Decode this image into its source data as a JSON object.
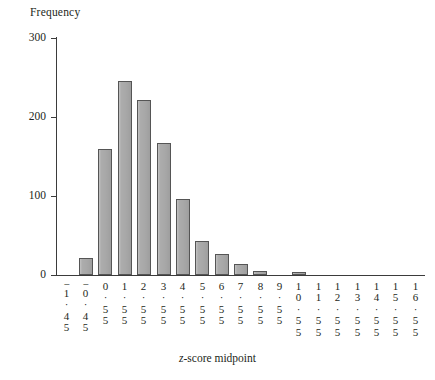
{
  "axes": {
    "y_title": "Frequency",
    "x_title_prefix": "z",
    "x_title_rest": "-score midpoint",
    "y_ticks": [
      "300",
      "200",
      "100",
      "0"
    ]
  },
  "chart_data": {
    "type": "bar",
    "title": "",
    "subtitle": "",
    "xlabel": "z-score midpoint",
    "ylabel": "Frequency",
    "ylim": [
      0,
      300
    ],
    "yticks": [
      0,
      100,
      200,
      300
    ],
    "grid": false,
    "legend": null,
    "bar_color": "#a8a8a8",
    "bar_edge_color": "#555555",
    "categories": [
      "-1.45",
      "-0.45",
      "0.55",
      "1.55",
      "2.55",
      "3.55",
      "4.55",
      "5.55",
      "6.55",
      "7.55",
      "8.55",
      "9.55",
      "10.55",
      "11.55",
      "12.55",
      "13.55",
      "14.55",
      "15.55",
      "16.55"
    ],
    "category_stacks": [
      [
        "−",
        "1",
        "·",
        "4",
        "5"
      ],
      [
        "−",
        "0",
        "·",
        "4",
        "5"
      ],
      [
        "0",
        "·",
        "5",
        "5"
      ],
      [
        "1",
        "·",
        "5",
        "5"
      ],
      [
        "2",
        "·",
        "5",
        "5"
      ],
      [
        "3",
        "·",
        "5",
        "5"
      ],
      [
        "4",
        "·",
        "5",
        "5"
      ],
      [
        "5",
        "·",
        "5",
        "5"
      ],
      [
        "6",
        "·",
        "5",
        "5"
      ],
      [
        "7",
        "·",
        "5",
        "5"
      ],
      [
        "8",
        "·",
        "5",
        "5"
      ],
      [
        "9",
        "·",
        "5",
        "5"
      ],
      [
        "1",
        "0",
        "·",
        "5",
        "5"
      ],
      [
        "1",
        "1",
        "·",
        "5",
        "5"
      ],
      [
        "1",
        "2",
        "·",
        "5",
        "5"
      ],
      [
        "1",
        "3",
        "·",
        "5",
        "5"
      ],
      [
        "1",
        "4",
        "·",
        "5",
        "5"
      ],
      [
        "1",
        "5",
        "·",
        "5",
        "5"
      ],
      [
        "1",
        "6",
        "·",
        "5",
        "5"
      ]
    ],
    "values": [
      0,
      22,
      160,
      245,
      222,
      167,
      96,
      43,
      27,
      14,
      5,
      0,
      4,
      0,
      0,
      0,
      0,
      0,
      0
    ]
  }
}
